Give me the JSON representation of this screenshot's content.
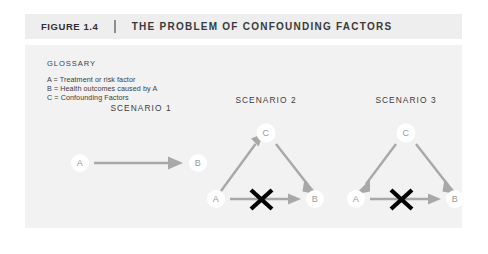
{
  "header": {
    "figure_number": "FIGURE 1.4",
    "divider": "|",
    "title": "THE PROBLEM OF CONFOUNDING FACTORS"
  },
  "glossary": {
    "heading": "GLOSSARY",
    "entries": [
      "A = Treatment or risk factor",
      "B = Health outcomes caused by A",
      "C = Confounding Factors"
    ]
  },
  "scenarios": [
    {
      "title": "SCENARIO 1",
      "nodes": [
        {
          "id": "A",
          "label": "A"
        },
        {
          "id": "B",
          "label": "B"
        }
      ],
      "edges": [
        {
          "from": "A",
          "to": "B",
          "blocked": false
        }
      ]
    },
    {
      "title": "SCENARIO 2",
      "nodes": [
        {
          "id": "C",
          "label": "C"
        },
        {
          "id": "A",
          "label": "A"
        },
        {
          "id": "B",
          "label": "B"
        }
      ],
      "edges": [
        {
          "from": "A",
          "to": "C",
          "blocked": false
        },
        {
          "from": "C",
          "to": "B",
          "blocked": false
        },
        {
          "from": "A",
          "to": "B",
          "blocked": true
        }
      ]
    },
    {
      "title": "SCENARIO 3",
      "nodes": [
        {
          "id": "C",
          "label": "C"
        },
        {
          "id": "A",
          "label": "A"
        },
        {
          "id": "B",
          "label": "B"
        }
      ],
      "edges": [
        {
          "from": "C",
          "to": "A",
          "blocked": false
        },
        {
          "from": "C",
          "to": "B",
          "blocked": false
        },
        {
          "from": "A",
          "to": "B",
          "blocked": true
        }
      ]
    }
  ],
  "colors": {
    "header_band": "#eeeeee",
    "panel_background": "#f2f2f2",
    "arrow": "#a8a8a8",
    "node_label": "#9a9a9a",
    "blocked_mark": "#000000",
    "text": "#3d3d3d"
  }
}
